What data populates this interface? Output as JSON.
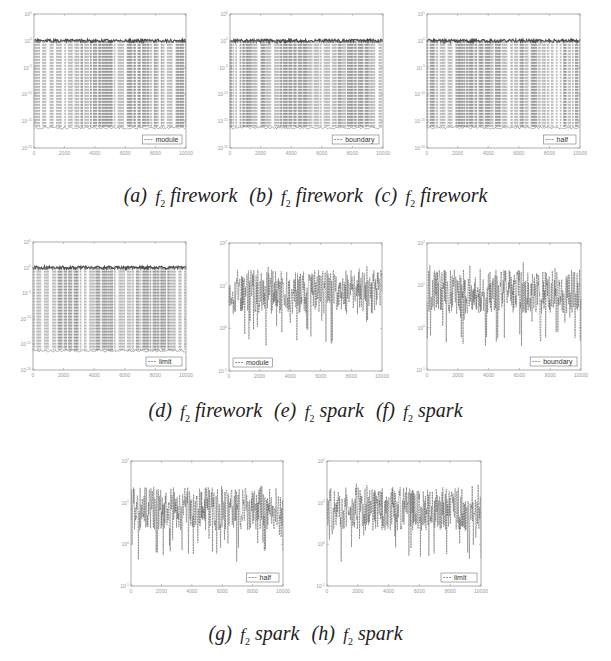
{
  "figure": {
    "captions": [
      [
        {
          "label": "(a)",
          "fn": "f",
          "sub": "2",
          "word": "firework"
        },
        {
          "label": "(b)",
          "fn": "f",
          "sub": "2",
          "word": "firework"
        },
        {
          "label": "(c)",
          "fn": "f",
          "sub": "2",
          "word": "firework"
        }
      ],
      [
        {
          "label": "(d)",
          "fn": "f",
          "sub": "2",
          "word": "firework"
        },
        {
          "label": "(e)",
          "fn": "f",
          "sub": "2",
          "word": "spark"
        },
        {
          "label": "(f)",
          "fn": "f",
          "sub": "2",
          "word": "spark"
        }
      ],
      [
        {
          "label": "(g)",
          "fn": "f",
          "sub": "2",
          "word": "spark"
        },
        {
          "label": "(h)",
          "fn": "f",
          "sub": "2",
          "word": "spark"
        }
      ]
    ]
  },
  "chart_data": [
    {
      "id": "a",
      "type": "line",
      "title": "(a) f2 firework",
      "legend": [
        "module"
      ],
      "legend_position": "lower right",
      "x_ticks": [
        "0",
        "2000",
        "4000",
        "6000",
        "8000",
        "10000"
      ],
      "xlim": [
        0,
        10000
      ],
      "yscale": "log",
      "y_ticks": [
        "10^5",
        "10^0",
        "10^-5",
        "10^-10",
        "10^-15",
        "10^-20"
      ],
      "ylim": [
        1e-20,
        100000.0
      ],
      "series": [
        {
          "name": "module",
          "style": "dashed",
          "upper_band": 1.0,
          "lower_band": 1e-16,
          "pattern": "oscillating spikes between ~1e0 and ~1e-16 across all 10000 iterations"
        }
      ]
    },
    {
      "id": "b",
      "type": "line",
      "title": "(b) f2 firework",
      "legend": [
        "boundary"
      ],
      "legend_position": "lower right",
      "x_ticks": [
        "0",
        "2000",
        "4000",
        "6000",
        "8000",
        "10000"
      ],
      "xlim": [
        0,
        10000
      ],
      "yscale": "log",
      "y_ticks": [
        "10^5",
        "10^0",
        "10^-5",
        "10^-10",
        "10^-15",
        "10^-20"
      ],
      "ylim": [
        1e-20,
        100000.0
      ],
      "series": [
        {
          "name": "boundary",
          "style": "dashed",
          "upper_band": 1.0,
          "lower_band": 1e-16,
          "pattern": "oscillating spikes between ~1e0 and ~1e-16"
        }
      ]
    },
    {
      "id": "c",
      "type": "line",
      "title": "(c) f2 firework",
      "legend": [
        "half"
      ],
      "legend_position": "lower right",
      "x_ticks": [
        "0",
        "2000",
        "4000",
        "6000",
        "8000",
        "10000"
      ],
      "xlim": [
        0,
        10000
      ],
      "yscale": "log",
      "y_ticks": [
        "10^5",
        "10^0",
        "10^-5",
        "10^-10",
        "10^-15",
        "10^-20"
      ],
      "ylim": [
        1e-20,
        100000.0
      ],
      "series": [
        {
          "name": "half",
          "style": "dashed",
          "upper_band": 1.0,
          "lower_band": 1e-16,
          "pattern": "oscillating spikes between ~1e0 and ~1e-16"
        }
      ]
    },
    {
      "id": "d",
      "type": "line",
      "title": "(d) f2 firework",
      "legend": [
        "limit"
      ],
      "legend_position": "lower right",
      "x_ticks": [
        "0",
        "2000",
        "4000",
        "6000",
        "8000",
        "10000"
      ],
      "xlim": [
        0,
        10000
      ],
      "yscale": "log",
      "y_ticks": [
        "10^5",
        "10^0",
        "10^-5",
        "10^-10",
        "10^-15",
        "10^-20"
      ],
      "ylim": [
        1e-20,
        100000.0
      ],
      "series": [
        {
          "name": "limit",
          "style": "dashed",
          "upper_band": 1.0,
          "lower_band": 1e-16,
          "pattern": "oscillating spikes between ~1e0 and ~1e-16"
        }
      ]
    },
    {
      "id": "e",
      "type": "line",
      "title": "(e) f2 spark",
      "legend": [
        "module"
      ],
      "legend_position": "lower left",
      "x_ticks": [
        "0",
        "2000",
        "4000",
        "6000",
        "8000",
        "10000"
      ],
      "xlim": [
        0,
        10000
      ],
      "yscale": "log",
      "y_ticks": [
        "10^2",
        "10^1",
        "10^0",
        "10^-1"
      ],
      "ylim": [
        0.1,
        100
      ],
      "series": [
        {
          "name": "module",
          "style": "dashed",
          "center": 10,
          "band": [
            1,
            30
          ],
          "pattern": "dense noise centered near 1e1, dips to ~0.5"
        }
      ]
    },
    {
      "id": "f",
      "type": "line",
      "title": "(f) f2 spark",
      "legend": [
        "boundary"
      ],
      "legend_position": "lower right",
      "x_ticks": [
        "0",
        "2000",
        "4000",
        "6000",
        "8000",
        "10000"
      ],
      "xlim": [
        0,
        10000
      ],
      "yscale": "log",
      "y_ticks": [
        "10^2",
        "10^1",
        "10^0",
        "10^-1"
      ],
      "ylim": [
        0.1,
        100
      ],
      "series": [
        {
          "name": "boundary",
          "style": "dashed",
          "center": 10,
          "band": [
            1,
            30
          ],
          "pattern": "dense noise centered near 1e1, deepest dip ~0.3 near x=2600"
        }
      ]
    },
    {
      "id": "g",
      "type": "line",
      "title": "(g) f2 spark",
      "legend": [
        "half"
      ],
      "legend_position": "lower right",
      "x_ticks": [
        "0",
        "2000",
        "4000",
        "6000",
        "8000",
        "10000"
      ],
      "xlim": [
        0,
        10000
      ],
      "yscale": "log",
      "y_ticks": [
        "10^2",
        "10^1",
        "10^0",
        "10^-1"
      ],
      "ylim": [
        0.1,
        100
      ],
      "series": [
        {
          "name": "half",
          "style": "dashed",
          "center": 10,
          "band": [
            1,
            30
          ],
          "pattern": "dense noise centered near 1e1, dips to ~0.5"
        }
      ]
    },
    {
      "id": "h",
      "type": "line",
      "title": "(h) f2 spark",
      "legend": [
        "limit"
      ],
      "legend_position": "lower right",
      "x_ticks": [
        "0",
        "2000",
        "4000",
        "6000",
        "8000",
        "10000"
      ],
      "xlim": [
        0,
        10000
      ],
      "yscale": "log",
      "y_ticks": [
        "10^2",
        "10^1",
        "10^0",
        "10^-1"
      ],
      "ylim": [
        0.1,
        100
      ],
      "series": [
        {
          "name": "limit",
          "style": "dashed",
          "center": 10,
          "band": [
            1,
            30
          ],
          "pattern": "dense noise centered near 1e1, deepest dip ~0.2 near x=4500"
        }
      ]
    }
  ],
  "layout": {
    "panels": [
      {
        "id": "a",
        "x": 34,
        "y": 14,
        "w": 152,
        "h": 134,
        "kind": "firework",
        "legend_pos": "right",
        "seed": 11
      },
      {
        "id": "b",
        "x": 230,
        "y": 14,
        "w": 153,
        "h": 134,
        "kind": "firework",
        "legend_pos": "right",
        "seed": 23
      },
      {
        "id": "c",
        "x": 427,
        "y": 14,
        "w": 153,
        "h": 134,
        "kind": "firework",
        "legend_pos": "right",
        "seed": 37
      },
      {
        "id": "d",
        "x": 33,
        "y": 242,
        "w": 153,
        "h": 128,
        "kind": "firework",
        "legend_pos": "right",
        "seed": 41
      },
      {
        "id": "e",
        "x": 229,
        "y": 243,
        "w": 153,
        "h": 128,
        "kind": "spark",
        "legend_pos": "left",
        "seed": 53
      },
      {
        "id": "f",
        "x": 427,
        "y": 243,
        "w": 154,
        "h": 127,
        "kind": "spark",
        "legend_pos": "right",
        "seed": 67
      },
      {
        "id": "g",
        "x": 131,
        "y": 461,
        "w": 152,
        "h": 125,
        "kind": "spark",
        "legend_pos": "right",
        "seed": 71
      },
      {
        "id": "h",
        "x": 327,
        "y": 461,
        "w": 154,
        "h": 125,
        "kind": "spark",
        "legend_pos": "right",
        "seed": 83
      }
    ],
    "caption_rows_y": [
      184,
      399,
      622
    ],
    "line_color": "#4a4a4a",
    "axis_color": "#9a9a9a"
  }
}
